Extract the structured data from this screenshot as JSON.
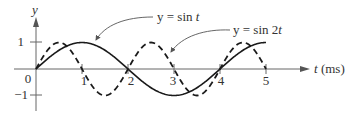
{
  "chart_data": {
    "type": "line",
    "title": "",
    "xlabel": "t (ms)",
    "ylabel": "y",
    "xlim": [
      0,
      5.9
    ],
    "ylim": [
      -1.3,
      1.9
    ],
    "grid": false,
    "x_ticks": [
      "1",
      "2",
      "3",
      "4",
      "5"
    ],
    "y_ticks": [
      "1",
      "0",
      "−1"
    ],
    "origin_label": "0",
    "series": [
      {
        "name": "y = sin t",
        "style": "solid",
        "period": 4,
        "x": [
          0,
          0.5,
          1,
          1.5,
          2,
          2.5,
          3,
          3.5,
          4,
          4.5,
          5
        ],
        "values": [
          0,
          0.71,
          1,
          0.71,
          0,
          -0.71,
          -1,
          -0.71,
          0,
          0.71,
          1
        ]
      },
      {
        "name": "y = sin 2t",
        "style": "dashed",
        "period": 2,
        "x": [
          0,
          0.5,
          1,
          1.5,
          2,
          2.5,
          3,
          3.5,
          4,
          4.5,
          5
        ],
        "values": [
          0,
          1,
          0,
          -1,
          0,
          1,
          0,
          -1,
          0,
          1,
          0
        ]
      }
    ],
    "annotations": [
      {
        "text": "y = sin t",
        "points_to": "solid curve near t≈1.3"
      },
      {
        "text": "y = sin 2t",
        "points_to": "dashed curve near t≈2.9"
      }
    ],
    "colors": {
      "curve": "#1a1a1a",
      "axis": "#555555",
      "text": "#333333"
    }
  },
  "labels": {
    "y_axis": "y",
    "x_axis": "t (ms)",
    "origin": "0",
    "ytick_1": "1",
    "ytick_m1": "−1",
    "xtick_1": "1",
    "xtick_2": "2",
    "xtick_3": "3",
    "xtick_4": "4",
    "xtick_5": "5",
    "annot_sin_t": "y = sin t",
    "annot_sin_2t": "y = sin 2t"
  }
}
